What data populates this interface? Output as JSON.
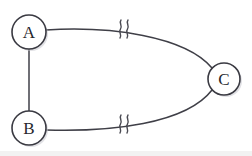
{
  "figure": {
    "title": "",
    "background_color": "#ffffff",
    "stroke_color": "#3f3f47",
    "node_fill": "#ffffff",
    "node_stroke": "#3a3a42",
    "label_color": "#27272d",
    "width": 252,
    "height": 156
  },
  "nodes": [
    {
      "id": "A",
      "label": "A",
      "cx": 29,
      "cy": 32,
      "r": 17
    },
    {
      "id": "B",
      "label": "B",
      "cx": 29,
      "cy": 128,
      "r": 17
    },
    {
      "id": "C",
      "label": "C",
      "cx": 224,
      "cy": 79,
      "r": 16
    }
  ],
  "edges": [
    {
      "id": "A-B",
      "from": "A",
      "to": "B",
      "shape": "straight",
      "has_break_symbol": false,
      "path": "M 29 49 L 29 111"
    },
    {
      "id": "A-C",
      "from": "A",
      "to": "C",
      "shape": "curved",
      "has_break_symbol": true,
      "break_symbol": "double-squiggle",
      "break_x": 124,
      "break_y": 29,
      "path": "M 46 30 C 110 26 185 36 212 68"
    },
    {
      "id": "B-C",
      "from": "B",
      "to": "C",
      "shape": "curved",
      "has_break_symbol": true,
      "break_symbol": "double-squiggle",
      "break_x": 124,
      "break_y": 124,
      "path": "M 46 130 C 110 132 186 124 212 90"
    }
  ],
  "break_symbols": [
    {
      "id": "break-top",
      "on_edge": "A-C",
      "x": 124,
      "y": 29,
      "glyph": "double-squiggle"
    },
    {
      "id": "break-bottom",
      "on_edge": "B-C",
      "x": 124,
      "y": 124,
      "glyph": "double-squiggle"
    }
  ]
}
